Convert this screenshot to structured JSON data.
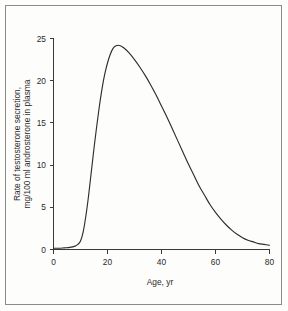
{
  "figure": {
    "frame_color": "#8a8a86",
    "background_color": "#fdfdfb",
    "curve_color": "#2e2e2c",
    "axis_color": "#3a3a38"
  },
  "chart_data": {
    "type": "line",
    "title": "",
    "subtitle": "",
    "xlabel": "Age, yr",
    "ylabel_line1": "Rate of testosterone secretion,",
    "ylabel_line2": "mg/100 ml androsterone in plasma",
    "ylabel": "Rate of testosterone secretion, mg/100 ml androsterone in plasma",
    "xlim": [
      0,
      80
    ],
    "ylim": [
      0,
      25
    ],
    "xticks": [
      0,
      20,
      40,
      60,
      80
    ],
    "yticks": [
      0,
      5,
      10,
      15,
      20,
      25
    ],
    "xtick_labels": [
      "0",
      "20",
      "40",
      "60",
      "80"
    ],
    "ytick_labels": [
      "0",
      "5",
      "10",
      "15",
      "20",
      "25"
    ],
    "grid": false,
    "legend": false,
    "legend_position": "none",
    "annotations": [],
    "series": [
      {
        "name": "Rate of testosterone secretion",
        "x": [
          0,
          2,
          4,
          6,
          8,
          9,
          10,
          11,
          12,
          13,
          14,
          15,
          16,
          17,
          18,
          19,
          20,
          21,
          22,
          23,
          24,
          25,
          26,
          28,
          30,
          32,
          34,
          36,
          38,
          40,
          42,
          44,
          46,
          48,
          50,
          52,
          54,
          56,
          58,
          60,
          62,
          64,
          66,
          68,
          70,
          72,
          74,
          76,
          78,
          80
        ],
        "y": [
          0.15,
          0.15,
          0.2,
          0.25,
          0.4,
          0.6,
          1.0,
          2.1,
          4.0,
          6.4,
          9.2,
          12.0,
          14.6,
          17.0,
          19.1,
          20.8,
          22.1,
          23.1,
          23.8,
          24.1,
          24.2,
          24.1,
          23.9,
          23.3,
          22.5,
          21.6,
          20.6,
          19.5,
          18.3,
          17.0,
          15.7,
          14.3,
          12.9,
          11.5,
          10.1,
          8.8,
          7.5,
          6.4,
          5.3,
          4.4,
          3.6,
          2.9,
          2.3,
          1.8,
          1.4,
          1.1,
          0.9,
          0.7,
          0.6,
          0.5
        ]
      }
    ],
    "peak": {
      "x": 24,
      "y": 24.2
    }
  }
}
